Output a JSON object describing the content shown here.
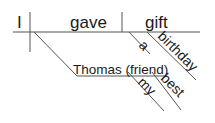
{
  "diagram": {
    "type": "sentence-diagram",
    "sentence": "I gave my best friend Thomas a birthday gift",
    "subject": "I",
    "verb": "gave",
    "direct_object": "gift",
    "direct_object_modifiers": [
      "a",
      "birthday"
    ],
    "indirect_object": "Thomas (friend)",
    "indirect_object_modifiers": [
      "my",
      "best"
    ],
    "colors": {
      "text": "#1a1a1a",
      "lines": "#555555",
      "background": "#ffffff"
    }
  }
}
